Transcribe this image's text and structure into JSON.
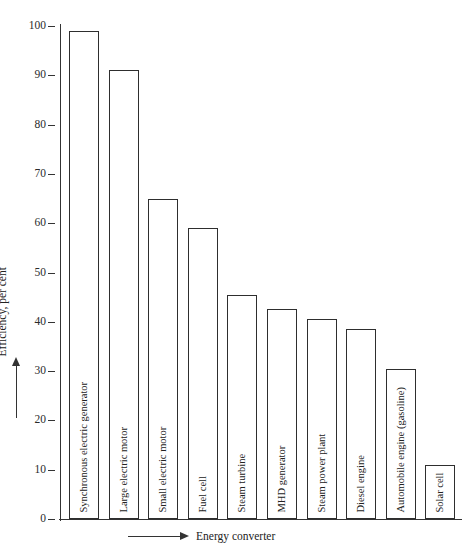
{
  "chart_data": {
    "type": "bar",
    "title": "",
    "xlabel": "Energy converter",
    "ylabel": "Efficiency, per cent",
    "ylim": [
      0,
      100
    ],
    "yticks": [
      0,
      10,
      20,
      30,
      40,
      50,
      60,
      70,
      80,
      90,
      100
    ],
    "ytick_labels": [
      "0",
      "10",
      "20",
      "30",
      "40",
      "50",
      "60",
      "70",
      "80",
      "90",
      "100"
    ],
    "grid": false,
    "legend": null,
    "bar_style": {
      "fill": "#ffffff",
      "edge": "#2e2e2e",
      "label_position": "inside-vertical"
    },
    "categories": [
      "Synchronous electric generator",
      "Large electric motor",
      "Small electric motor",
      "Fuel cell",
      "Steam turbine",
      "MHD generator",
      "Steam power plant",
      "Diesel engine",
      "Automobile engine (gasoline)",
      "Solar cell"
    ],
    "values": [
      99,
      91,
      65,
      59,
      45.5,
      42.5,
      40.5,
      38.5,
      30.5,
      11
    ]
  }
}
